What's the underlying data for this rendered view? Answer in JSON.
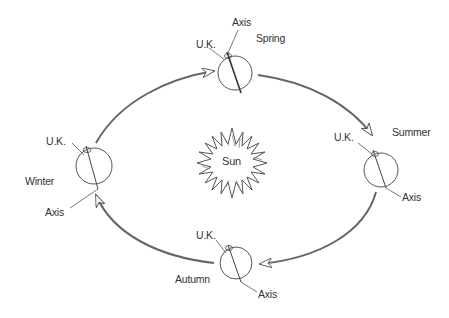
{
  "diagram": {
    "center_label": "Sun",
    "colors": {
      "line": "#555555",
      "text": "#333333",
      "background": "#ffffff"
    },
    "positions": [
      {
        "season": "Spring",
        "uk_label": "U.K.",
        "axis_label": "Axis"
      },
      {
        "season": "Summer",
        "uk_label": "U.K.",
        "axis_label": "Axis"
      },
      {
        "season": "Autumn",
        "uk_label": "U.K.",
        "axis_label": "Axis"
      },
      {
        "season": "Winter",
        "uk_label": "U.K.",
        "axis_label": "Axis"
      }
    ],
    "orbit_direction": "clockwise"
  }
}
